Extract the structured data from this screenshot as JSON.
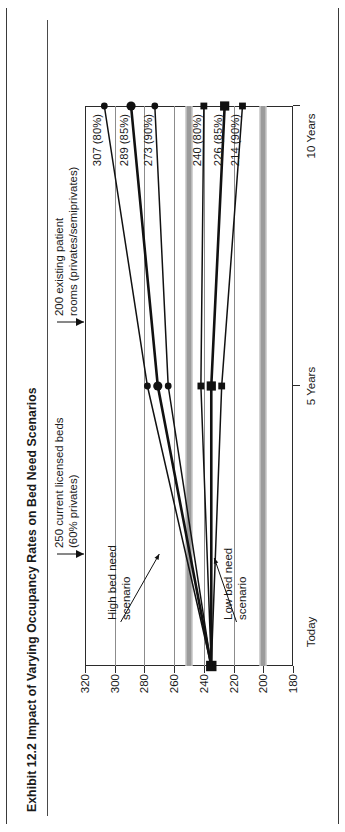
{
  "title": "Exhibit 12.2 Impact of Varying Occupancy Rates on Bed Need Scenarios",
  "annotations": {
    "high": "High bed need\nscenario",
    "high_line1": "High bed need",
    "high_line2": "scenario",
    "low_line1": "Low bed need",
    "low_line2": "scenario",
    "ref250_line1": "250 current licensed beds",
    "ref250_line2": "(60% privates)",
    "ref200_line1": "200 existing patient",
    "ref200_line2": "rooms (privates/semiprivates)"
  },
  "colors": {
    "line": "#111111",
    "refband": "#9b9b9b",
    "grid": "#8c8c8c",
    "frame": "#2b2b2b",
    "text": "#1a1a1a"
  },
  "chart_data": {
    "type": "line",
    "title": "Exhibit 12.2 Impact of Varying Occupancy Rates on Bed Need Scenarios",
    "xlabel": "",
    "ylabel": "",
    "x": [
      "Today",
      "5 Years",
      "10 Years"
    ],
    "categories": [
      "Today",
      "5 Years",
      "10 Years"
    ],
    "ylim": [
      180,
      320
    ],
    "yticks": [
      320,
      300,
      280,
      260,
      240,
      220,
      200,
      180
    ],
    "ytick_labels": [
      "320",
      "300",
      "280",
      "260",
      "240",
      "220",
      "200",
      "180"
    ],
    "grid": true,
    "legend": "none",
    "series": [
      {
        "name": "High bed need 80%",
        "group": "high",
        "occupancy": "80%",
        "marker": "circle",
        "values": [
          235,
          278,
          307
        ],
        "end_label": "307 (80%)"
      },
      {
        "name": "High bed need 85%",
        "group": "high",
        "occupancy": "85%",
        "marker": "circle",
        "values": [
          235,
          271,
          289
        ],
        "end_label": "289 (85%)"
      },
      {
        "name": "High bed need 90%",
        "group": "high",
        "occupancy": "90%",
        "marker": "circle",
        "values": [
          235,
          264,
          273
        ],
        "end_label": "273 (90%)"
      },
      {
        "name": "Low bed need 80%",
        "group": "low",
        "occupancy": "80%",
        "marker": "square",
        "values": [
          235,
          242,
          240
        ],
        "end_label": "240 (80%)"
      },
      {
        "name": "Low bed need 85%",
        "group": "low",
        "occupancy": "85%",
        "marker": "square",
        "values": [
          235,
          235,
          226
        ],
        "end_label": "226 (85%)"
      },
      {
        "name": "Low bed need 90%",
        "group": "low",
        "occupancy": "90%",
        "marker": "square",
        "values": [
          235,
          228,
          214
        ],
        "end_label": "214 (90%)"
      }
    ],
    "reference_lines": [
      {
        "value": 250,
        "label": "250 current licensed beds (60% privates)",
        "style": "gray band"
      },
      {
        "value": 200,
        "label": "200 existing patient rooms (privates/semiprivates)",
        "style": "gray band"
      }
    ],
    "annotations": [
      {
        "text": "High bed need scenario",
        "points_to": "high series"
      },
      {
        "text": "Low bed need scenario",
        "points_to": "low series"
      }
    ]
  }
}
